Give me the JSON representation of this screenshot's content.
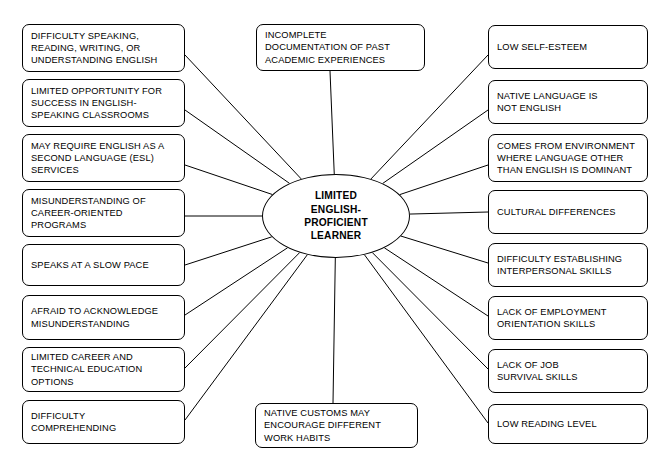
{
  "diagram": {
    "type": "spider-web-concept-map",
    "center": {
      "label": "LIMITED\nENGLISH-\nPROFICIENT\nLEARNER",
      "shape": "ellipse",
      "cx": 336,
      "cy": 216,
      "rx": 74,
      "ry": 42
    },
    "style": {
      "stroke": "#000000",
      "fill": "#ffffff",
      "background": "#ffffff"
    },
    "nodes": [
      {
        "id": "difficulty-speaking-reading-writing",
        "label": "DIFFICULTY SPEAKING,\nREADING, WRITING, OR\nUNDERSTANDING ENGLISH",
        "side": "left",
        "x": 22,
        "y": 24,
        "w": 163,
        "h": 48,
        "anchor_x": 185,
        "anchor_y": 55
      },
      {
        "id": "limited-opportunity-success-english-classrooms",
        "label": "LIMITED OPPORTUNITY FOR\nSUCCESS IN ENGLISH-\nSPEAKING CLASSROOMS",
        "side": "left",
        "x": 22,
        "y": 79,
        "w": 163,
        "h": 48,
        "anchor_x": 185,
        "anchor_y": 110
      },
      {
        "id": "may-require-esl-services",
        "label": "MAY REQUIRE ENGLISH AS A\nSECOND LANGUAGE (ESL)\nSERVICES",
        "side": "left",
        "x": 22,
        "y": 134,
        "w": 163,
        "h": 48,
        "anchor_x": 185,
        "anchor_y": 165
      },
      {
        "id": "misunderstanding-career-oriented-programs",
        "label": "MISUNDERSTANDING OF\nCAREER-ORIENTED\nPROGRAMS",
        "side": "left",
        "x": 22,
        "y": 189,
        "w": 163,
        "h": 48,
        "anchor_x": 185,
        "anchor_y": 216
      },
      {
        "id": "speaks-at-a-slow-pace",
        "label": "SPEAKS AT A SLOW PACE",
        "side": "left",
        "x": 22,
        "y": 244,
        "w": 163,
        "h": 42,
        "anchor_x": 185,
        "anchor_y": 265
      },
      {
        "id": "afraid-to-acknowledge-misunderstanding",
        "label": "AFRAID TO ACKNOWLEDGE\nMISUNDERSTANDING",
        "side": "left",
        "x": 22,
        "y": 295,
        "w": 163,
        "h": 45,
        "anchor_x": 185,
        "anchor_y": 315
      },
      {
        "id": "limited-career-technical-education-options",
        "label": "LIMITED CAREER AND\nTECHNICAL EDUCATION\nOPTIONS",
        "side": "left",
        "x": 22,
        "y": 347,
        "w": 163,
        "h": 45,
        "anchor_x": 185,
        "anchor_y": 368
      },
      {
        "id": "difficulty-comprehending",
        "label": "DIFFICULTY\nCOMPREHENDING",
        "side": "left",
        "x": 22,
        "y": 400,
        "w": 163,
        "h": 44,
        "anchor_x": 185,
        "anchor_y": 420
      },
      {
        "id": "incomplete-documentation-past-academic",
        "label": "INCOMPLETE\nDOCUMENTATION OF PAST\nACADEMIC EXPERIENCES",
        "side": "top",
        "x": 256,
        "y": 24,
        "w": 169,
        "h": 47,
        "anchor_x": 330,
        "anchor_y": 71
      },
      {
        "id": "native-customs-work-habits",
        "label": "NATIVE CUSTOMS MAY\nENCOURAGE DIFFERENT\nWORK HABITS",
        "side": "bottom",
        "x": 255,
        "y": 403,
        "w": 163,
        "h": 45,
        "anchor_x": 333,
        "anchor_y": 403
      },
      {
        "id": "low-self-esteem",
        "label": "LOW SELF-ESTEEM",
        "side": "right",
        "x": 488,
        "y": 25,
        "w": 160,
        "h": 44,
        "anchor_x": 488,
        "anchor_y": 55
      },
      {
        "id": "native-language-not-english",
        "label": "NATIVE LANGUAGE IS\nNOT ENGLISH",
        "side": "right",
        "x": 488,
        "y": 80,
        "w": 160,
        "h": 44,
        "anchor_x": 488,
        "anchor_y": 110
      },
      {
        "id": "comes-from-environment-language-other",
        "label": "COMES FROM ENVIRONMENT\nWHERE LANGUAGE OTHER\nTHAN ENGLISH IS DOMINANT",
        "side": "right",
        "x": 488,
        "y": 134,
        "w": 160,
        "h": 48,
        "anchor_x": 488,
        "anchor_y": 165
      },
      {
        "id": "cultural-differences",
        "label": "CULTURAL DIFFERENCES",
        "side": "right",
        "x": 488,
        "y": 190,
        "w": 160,
        "h": 44,
        "anchor_x": 488,
        "anchor_y": 212
      },
      {
        "id": "difficulty-establishing-interpersonal-skills",
        "label": "DIFFICULTY ESTABLISHING\nINTERPERSONAL SKILLS",
        "side": "right",
        "x": 488,
        "y": 243,
        "w": 160,
        "h": 44,
        "anchor_x": 488,
        "anchor_y": 263
      },
      {
        "id": "lack-of-employment-orientation-skills",
        "label": "LACK OF EMPLOYMENT\nORIENTATION SKILLS",
        "side": "right",
        "x": 488,
        "y": 296,
        "w": 160,
        "h": 44,
        "anchor_x": 488,
        "anchor_y": 316
      },
      {
        "id": "lack-of-job-survival-skills",
        "label": "LACK OF JOB\nSURVIVAL SKILLS",
        "side": "right",
        "x": 488,
        "y": 349,
        "w": 160,
        "h": 44,
        "anchor_x": 488,
        "anchor_y": 369
      },
      {
        "id": "low-reading-level",
        "label": "LOW READING LEVEL",
        "side": "right",
        "x": 488,
        "y": 404,
        "w": 160,
        "h": 40,
        "anchor_x": 488,
        "anchor_y": 423
      }
    ]
  }
}
